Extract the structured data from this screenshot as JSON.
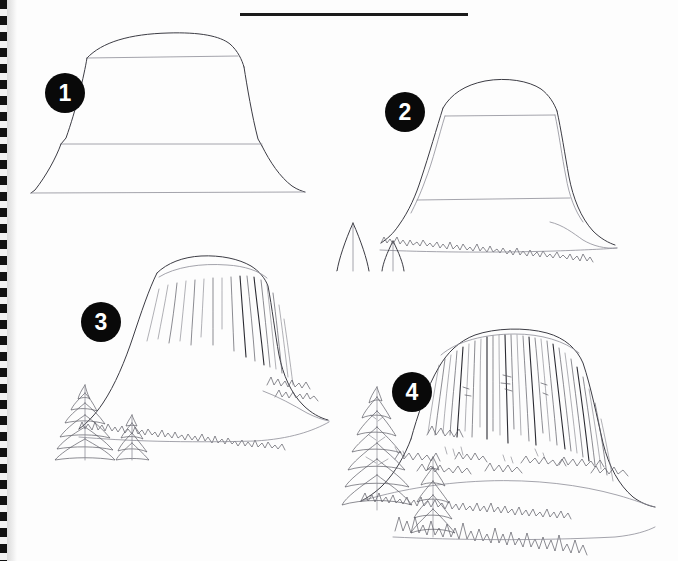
{
  "page": {
    "medium": "pencil sketch on spiral sketchbook page",
    "background_color": "#fdfdfd",
    "ink_color": "#3c3c44",
    "badge_color": "#090909",
    "badge_text_color": "#ffffff",
    "width": 678,
    "height": 561
  },
  "binding": {
    "name": "spiral-binding",
    "edge": "left",
    "color_dark": "#111111",
    "color_light": "#f2f2f2"
  },
  "top_rule": {
    "name": "horizontal-rule",
    "color": "#1b1b1b"
  },
  "steps": [
    {
      "number": "1",
      "caption": "",
      "description": "Basic trapezoid block-in of the tower with construction guide lines and flared base skirt"
    },
    {
      "number": "2",
      "caption": "",
      "description": "Refined contour of the rock with a tree line at the base and two simple tree silhouettes"
    },
    {
      "number": "3",
      "caption": "",
      "description": "Vertical columnar striations added to the tower and layered conifer trees in the foreground"
    },
    {
      "number": "4",
      "caption": "",
      "description": "Fully rendered tower with dense column jointing, rocky talus slope and detailed forest"
    }
  ]
}
